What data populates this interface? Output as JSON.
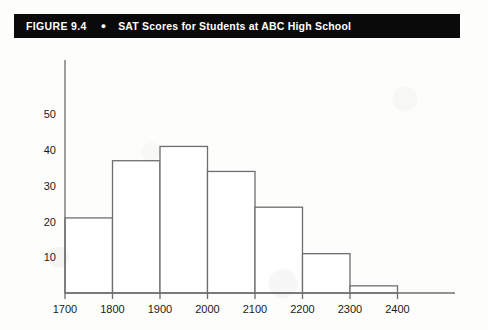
{
  "figure": {
    "number_label": "FIGURE 9.4",
    "bullet": "●",
    "title": "SAT Scores for Students at ABC High School"
  },
  "colors": {
    "title_bar_bg": "#0a0a0a",
    "title_text": "#ffffff",
    "axis": "#6e6e6e",
    "bar_outline": "#6e6e6e",
    "bar_fill": "#ffffff",
    "page_bg": "#fdfdfc",
    "tick_text": "#1a1a1a"
  },
  "chart_data": {
    "type": "bar",
    "title": "SAT Scores for Students at ABC High School",
    "xlabel": "",
    "ylabel": "",
    "grid": false,
    "legend": null,
    "bin_edges": [
      1700,
      1800,
      1900,
      2000,
      2100,
      2200,
      2300
    ],
    "categories": [
      "1700-1800",
      "1800-1900",
      "1900-2000",
      "2000-2100",
      "2100-2200",
      "2200-2300",
      "2300-2400"
    ],
    "values": [
      21,
      37,
      41,
      34,
      24,
      11,
      2
    ],
    "x_tick_labels": [
      "1700",
      "1800",
      "1900",
      "2000",
      "2100",
      "2200",
      "2300",
      "2400"
    ],
    "y_tick_labels": [
      "10",
      "20",
      "30",
      "40",
      "50"
    ],
    "y_tick_values": [
      10,
      20,
      30,
      40,
      50
    ],
    "xlim": [
      1700,
      2400
    ],
    "ylim": [
      0,
      57
    ]
  }
}
